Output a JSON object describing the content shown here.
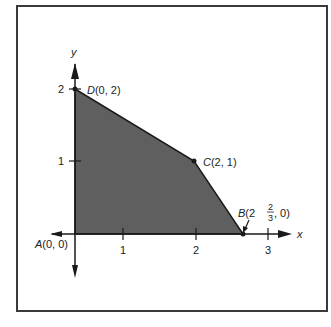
{
  "diagram": {
    "type": "feasible-region",
    "axes": {
      "x_label": "x",
      "y_label": "y",
      "x_ticks": [
        "1",
        "2",
        "3"
      ],
      "y_ticks": [
        "1",
        "2"
      ]
    },
    "points": [
      {
        "name": "A",
        "coords": "(0, 0)",
        "x": 0,
        "y": 0
      },
      {
        "name": "B",
        "coords_prefix": "(2",
        "frac_num": "2",
        "frac_den": "3",
        "coords_suffix": ", 0)",
        "x": 2.6667,
        "y": 0
      },
      {
        "name": "C",
        "coords": "(2, 1)",
        "x": 2,
        "y": 1
      },
      {
        "name": "D",
        "coords": "(0, 2)",
        "x": 0,
        "y": 2
      }
    ],
    "region_fill": "#5f5f5f",
    "line_color": "#1a1a1a"
  }
}
